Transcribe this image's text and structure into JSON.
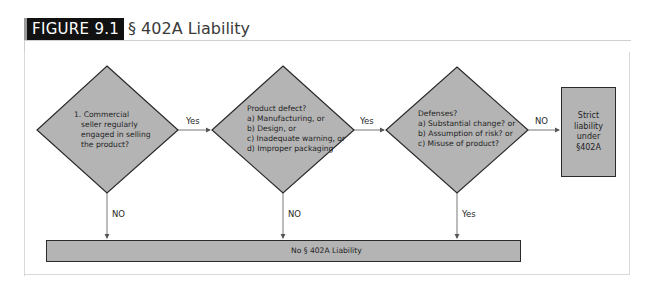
{
  "figure": {
    "label": "FIGURE 9.1",
    "title": "§ 402A Liability"
  },
  "colors": {
    "shape_fill": "#b4b4b4",
    "shape_stroke": "#2a2a2a",
    "connector": "#6a6a6a",
    "label_bg": "#111111"
  },
  "nodes": {
    "decision1": {
      "lines": [
        "1. Commercial",
        "seller regularly",
        "engaged in selling",
        "the product?"
      ]
    },
    "decision2": {
      "lines": [
        "Product defect?",
        "a) Manufacturing, or",
        "b) Design, or",
        "c) Inadequate warning, or",
        "d) Improper packaging"
      ]
    },
    "decision3": {
      "lines": [
        "Defenses?",
        "a) Substantial change? or",
        "b) Assumption of risk? or",
        "c) Misuse of product?"
      ]
    },
    "strict": {
      "lines": [
        "Strict",
        "liability",
        "under",
        "§402A"
      ]
    },
    "no_liability": {
      "text": "No § 402A Liability"
    }
  },
  "edges": {
    "d1_to_d2": "Yes",
    "d2_to_d3": "Yes",
    "d3_to_strict": "NO",
    "d1_down": "NO",
    "d2_down": "NO",
    "d3_down": "Yes"
  }
}
